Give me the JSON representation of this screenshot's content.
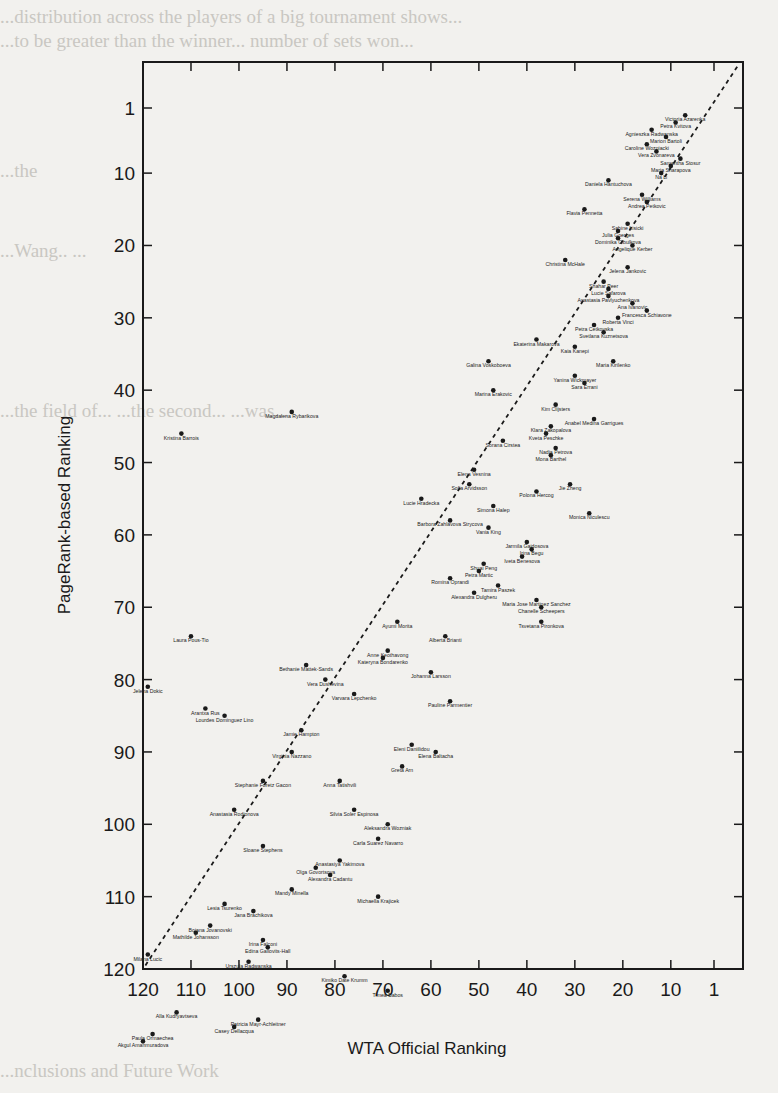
{
  "page": {
    "background_text": [
      {
        "y": 6,
        "text": "...distribution across the players of a big tournament shows..."
      },
      {
        "y": 30,
        "text": "...to be greater than the winner... number of sets won..."
      },
      {
        "y": 160,
        "text": "                                                             ...the"
      },
      {
        "y": 240,
        "text": "                                                       ...Wang.. ..."
      },
      {
        "y": 400,
        "text": "              ...the field of... ...the second... ...was..."
      },
      {
        "y": 1060,
        "text": "              ...nclusions and Future Work"
      }
    ]
  },
  "chart_data": {
    "type": "scatter",
    "title": "",
    "xlabel": "WTA Official Ranking",
    "ylabel": "PageRank-based Ranking",
    "x_reversed": true,
    "y_reversed": true,
    "xlim": [
      120,
      1
    ],
    "ylim": [
      120,
      1
    ],
    "x_ticks": [
      120,
      110,
      100,
      90,
      80,
      70,
      60,
      50,
      40,
      30,
      20,
      10,
      1
    ],
    "y_ticks": [
      1,
      10,
      20,
      30,
      40,
      50,
      60,
      70,
      80,
      90,
      100,
      110,
      120
    ],
    "grid": false,
    "legend": null,
    "reference_line": {
      "style": "dashed",
      "description": "y = x diagonal"
    },
    "points": [
      {
        "name": "Victoria Azarenka",
        "wta": 7,
        "pr": 2
      },
      {
        "name": "Petra Kvitova",
        "wta": 9,
        "pr": 3
      },
      {
        "name": "Agnieszka Radwanska",
        "wta": 14,
        "pr": 4
      },
      {
        "name": "Marion Bartoli",
        "wta": 11,
        "pr": 5
      },
      {
        "name": "Caroline Wozniacki",
        "wta": 15,
        "pr": 6
      },
      {
        "name": "Vera Zvonareva",
        "wta": 13,
        "pr": 7
      },
      {
        "name": "Samantha Stosur",
        "wta": 8,
        "pr": 8
      },
      {
        "name": "Maria Sharapova",
        "wta": 10,
        "pr": 9
      },
      {
        "name": "Na Li",
        "wta": 12,
        "pr": 10
      },
      {
        "name": "Daniela Hantuchova",
        "wta": 23,
        "pr": 11
      },
      {
        "name": "Serena Williams",
        "wta": 16,
        "pr": 13
      },
      {
        "name": "Andrea Petkovic",
        "wta": 15,
        "pr": 14
      },
      {
        "name": "Flavia Pennetta",
        "wta": 28,
        "pr": 15
      },
      {
        "name": "Sabine Lisicki",
        "wta": 19,
        "pr": 17
      },
      {
        "name": "Julia Goerges",
        "wta": 21,
        "pr": 18
      },
      {
        "name": "Dominika Cibulkova",
        "wta": 21,
        "pr": 19
      },
      {
        "name": "Angelique Kerber",
        "wta": 18,
        "pr": 20
      },
      {
        "name": "Christina McHale",
        "wta": 32,
        "pr": 22
      },
      {
        "name": "Jelena Jankovic",
        "wta": 19,
        "pr": 23
      },
      {
        "name": "Shahar Peer",
        "wta": 24,
        "pr": 25
      },
      {
        "name": "Lucie Safarova",
        "wta": 23,
        "pr": 26
      },
      {
        "name": "Anastasia Pavlyuchenkova",
        "wta": 23,
        "pr": 27
      },
      {
        "name": "Ana Ivanovic",
        "wta": 18,
        "pr": 28
      },
      {
        "name": "Francesca Schiavone",
        "wta": 15,
        "pr": 29
      },
      {
        "name": "Roberta Vinci",
        "wta": 21,
        "pr": 30
      },
      {
        "name": "Petra Cetkovska",
        "wta": 26,
        "pr": 31
      },
      {
        "name": "Svetlana Kuznetsova",
        "wta": 24,
        "pr": 32
      },
      {
        "name": "Ekaterina Makarova",
        "wta": 38,
        "pr": 33
      },
      {
        "name": "Kaia Kanepi",
        "wta": 30,
        "pr": 34
      },
      {
        "name": "Galina Voskoboeva",
        "wta": 48,
        "pr": 36
      },
      {
        "name": "Maria Kirilenko",
        "wta": 22,
        "pr": 36
      },
      {
        "name": "Yanina Wickmayer",
        "wta": 30,
        "pr": 38
      },
      {
        "name": "Sara Errani",
        "wta": 28,
        "pr": 39
      },
      {
        "name": "Marina Erakovic",
        "wta": 47,
        "pr": 40
      },
      {
        "name": "Kim Clijsters",
        "wta": 34,
        "pr": 42
      },
      {
        "name": "Anabel Medina Garrigues",
        "wta": 26,
        "pr": 44
      },
      {
        "name": "Klara Zakopalova",
        "wta": 35,
        "pr": 45
      },
      {
        "name": "Magdalena Rybarikova",
        "wta": 89,
        "pr": 43
      },
      {
        "name": "Kveta Peschke",
        "wta": 36,
        "pr": 46
      },
      {
        "name": "Sorana Cirstea",
        "wta": 45,
        "pr": 47
      },
      {
        "name": "Nadia Petrova",
        "wta": 34,
        "pr": 48
      },
      {
        "name": "Mona Barthel",
        "wta": 35,
        "pr": 49
      },
      {
        "name": "Kristina Barrois",
        "wta": 112,
        "pr": 46
      },
      {
        "name": "Elena Vesnina",
        "wta": 51,
        "pr": 51
      },
      {
        "name": "Jie Zheng",
        "wta": 31,
        "pr": 53
      },
      {
        "name": "Sofia Arvidsson",
        "wta": 52,
        "pr": 53
      },
      {
        "name": "Polona Hercog",
        "wta": 38,
        "pr": 54
      },
      {
        "name": "Lucie Hradecka",
        "wta": 62,
        "pr": 55
      },
      {
        "name": "Simona Halep",
        "wta": 47,
        "pr": 56
      },
      {
        "name": "Monica Niculescu",
        "wta": 27,
        "pr": 57
      },
      {
        "name": "Barbora Zahlavova Strycova",
        "wta": 56,
        "pr": 58
      },
      {
        "name": "Vania King",
        "wta": 48,
        "pr": 59
      },
      {
        "name": "Jarmila Gajdosova",
        "wta": 40,
        "pr": 61
      },
      {
        "name": "Irina Begu",
        "wta": 39,
        "pr": 62
      },
      {
        "name": "Iveta Benesova",
        "wta": 41,
        "pr": 63
      },
      {
        "name": "Shuai Peng",
        "wta": 49,
        "pr": 64
      },
      {
        "name": "Petra Martic",
        "wta": 50,
        "pr": 65
      },
      {
        "name": "Romina Oprandi",
        "wta": 56,
        "pr": 66
      },
      {
        "name": "Tamira Paszek",
        "wta": 46,
        "pr": 67
      },
      {
        "name": "Alexandra Dulgheru",
        "wta": 51,
        "pr": 68
      },
      {
        "name": "Maria Jose Martinez Sanchez",
        "wta": 38,
        "pr": 69
      },
      {
        "name": "Chanelle Scheepers",
        "wta": 37,
        "pr": 70
      },
      {
        "name": "Ayumi Morita",
        "wta": 67,
        "pr": 72
      },
      {
        "name": "Tsvetana Pironkova",
        "wta": 37,
        "pr": 72
      },
      {
        "name": "Alberta Brianti",
        "wta": 57,
        "pr": 74
      },
      {
        "name": "Laura Pous-Tio",
        "wta": 110,
        "pr": 74
      },
      {
        "name": "Anne Keothavong",
        "wta": 69,
        "pr": 76
      },
      {
        "name": "Kateryna Bondarenko",
        "wta": 70,
        "pr": 77
      },
      {
        "name": "Bethanie Mattek-Sands",
        "wta": 86,
        "pr": 78
      },
      {
        "name": "Johanna Larsson",
        "wta": 60,
        "pr": 79
      },
      {
        "name": "Vera Dushevina",
        "wta": 82,
        "pr": 80
      },
      {
        "name": "Jelena Dokic",
        "wta": 119,
        "pr": 81
      },
      {
        "name": "Varvara Lepchenko",
        "wta": 76,
        "pr": 82
      },
      {
        "name": "Pauline Parmentier",
        "wta": 56,
        "pr": 83
      },
      {
        "name": "Arantxa Rus",
        "wta": 107,
        "pr": 84
      },
      {
        "name": "Lourdes Dominguez Lino",
        "wta": 103,
        "pr": 85
      },
      {
        "name": "Jamie Hampton",
        "wta": 87,
        "pr": 87
      },
      {
        "name": "Eleni Daniilidou",
        "wta": 64,
        "pr": 89
      },
      {
        "name": "Elena Baltacha",
        "wta": 59,
        "pr": 90
      },
      {
        "name": "Virginia Nazzano",
        "wta": 89,
        "pr": 90
      },
      {
        "name": "Greta Arn",
        "wta": 66,
        "pr": 92
      },
      {
        "name": "Stephanie Foretz Gacon",
        "wta": 95,
        "pr": 94
      },
      {
        "name": "Anna Tatishvili",
        "wta": 79,
        "pr": 94
      },
      {
        "name": "Anastasia Rodionova",
        "wta": 101,
        "pr": 98
      },
      {
        "name": "Silvia Soler Espinosa",
        "wta": 76,
        "pr": 98
      },
      {
        "name": "Aleksandra Wozniak",
        "wta": 69,
        "pr": 100
      },
      {
        "name": "Carla Suarez Navarro",
        "wta": 71,
        "pr": 102
      },
      {
        "name": "Sloane Stephens",
        "wta": 95,
        "pr": 103
      },
      {
        "name": "Anastasiya Yakimova",
        "wta": 79,
        "pr": 105
      },
      {
        "name": "Olga Govortsova",
        "wta": 84,
        "pr": 106
      },
      {
        "name": "Alexandra Cadantu",
        "wta": 81,
        "pr": 107
      },
      {
        "name": "Mandy Minella",
        "wta": 89,
        "pr": 109
      },
      {
        "name": "Michaella Krajicek",
        "wta": 71,
        "pr": 110
      },
      {
        "name": "Lesia Tsurenko",
        "wta": 103,
        "pr": 111
      },
      {
        "name": "Jana Brachikova",
        "wta": 97,
        "pr": 112
      },
      {
        "name": "Bojana Jovanovski",
        "wta": 106,
        "pr": 114
      },
      {
        "name": "Mathilde Johansson",
        "wta": 109,
        "pr": 115
      },
      {
        "name": "Irina Falconi",
        "wta": 95,
        "pr": 116
      },
      {
        "name": "Edina Gallovits-Hall",
        "wta": 94,
        "pr": 117
      },
      {
        "name": "Milana Lucic",
        "wta": 119,
        "pr": 118
      },
      {
        "name": "Urszula Radwanska",
        "wta": 98,
        "pr": 119
      },
      {
        "name": "Kimiko Date Krumm",
        "wta": 78,
        "pr": 121
      },
      {
        "name": "Timea Babos",
        "wta": 69,
        "pr": 123
      },
      {
        "name": "Alla Kudryavtseva",
        "wta": 113,
        "pr": 126
      },
      {
        "name": "Patricia Mayr-Achleitner",
        "wta": 96,
        "pr": 127
      },
      {
        "name": "Casey Dellacqua",
        "wta": 101,
        "pr": 128
      },
      {
        "name": "Paula Ormaechea",
        "wta": 118,
        "pr": 129
      },
      {
        "name": "Akgul Amanmuradova",
        "wta": 120,
        "pr": 130
      }
    ]
  },
  "plot": {
    "frame": {
      "left": 143,
      "right": 743,
      "top": 62,
      "bottom": 969
    },
    "x_map": {
      "rank_a": 120,
      "px_a": 143,
      "rank_b": 1,
      "px_b": 714
    },
    "y_map": {
      "rank_a": 1,
      "px_a": 108,
      "rank_b": 120,
      "px_b": 969
    },
    "colors": {
      "ink": "#1a1a1a",
      "paper": "#f2f1ee",
      "faded_text": "#c9c7c2"
    }
  }
}
